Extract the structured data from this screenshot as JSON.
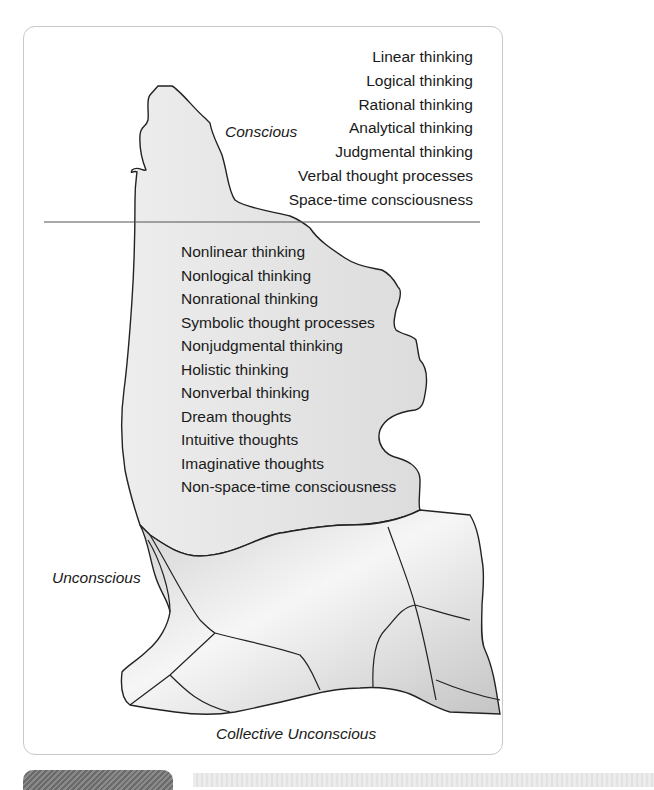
{
  "diagram": {
    "type": "iceberg",
    "labels": {
      "conscious": "Conscious",
      "unconscious": "Unconscious",
      "collective_unconscious": "Collective Unconscious"
    },
    "conscious_items": [
      "Linear thinking",
      "Logical thinking",
      "Rational thinking",
      "Analytical thinking",
      "Judgmental thinking",
      "Verbal thought processes",
      "Space-time consciousness"
    ],
    "unconscious_items": [
      "Nonlinear thinking",
      "Nonlogical thinking",
      "Nonrational thinking",
      "Symbolic thought processes",
      "Nonjudgmental thinking",
      "Holistic thinking",
      "Nonverbal thinking",
      "Dream thoughts",
      "Intuitive thoughts",
      "Imaginative thoughts",
      "Non-space-time consciousness"
    ],
    "colors": {
      "outline": "#222222",
      "fill": "#e6e6e6",
      "waterline": "#555555",
      "frame": "#c8c8c8"
    }
  }
}
